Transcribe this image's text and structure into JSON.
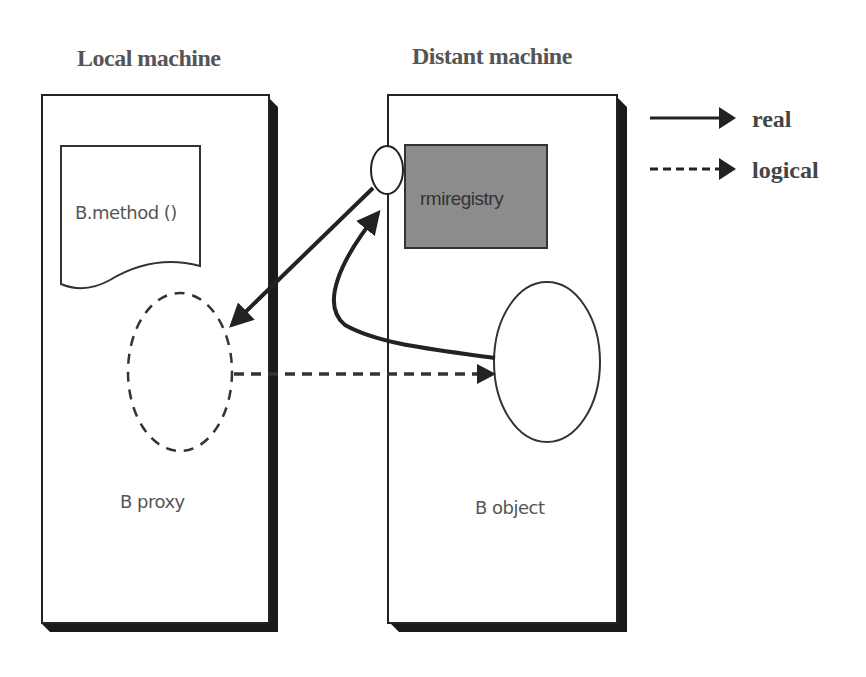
{
  "diagram": {
    "local_machine": {
      "title": "Local machine",
      "document_label": "B.method ()",
      "proxy_label": "B proxy"
    },
    "distant_machine": {
      "title": "Distant machine",
      "registry_label": "rmiregistry",
      "object_label": "B object"
    },
    "legend": [
      {
        "style": "solid",
        "label": "real"
      },
      {
        "style": "dashed",
        "label": "logical"
      }
    ],
    "colors": {
      "border": "#222222",
      "shadow": "#1a1a1a",
      "registry_fill": "#8c8c8c",
      "text": "#555555"
    }
  }
}
